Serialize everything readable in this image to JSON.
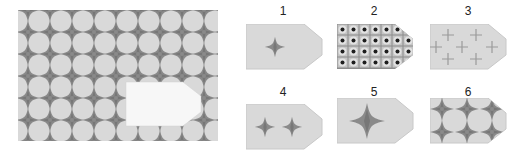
{
  "puzzle": {
    "main_panel": {
      "description": "pattern with missing piece",
      "background_color": "#d9d9d9",
      "star_color": "#8a8a8a",
      "grid": {
        "columns": 9,
        "rows": 7,
        "pitch": 22
      }
    },
    "colors": {
      "tile_bg": "#d9d9d9",
      "star": "#8a8a8a",
      "star_dark": "#777777",
      "cross": "#9a9a9a",
      "cutout": "#f7f7f7",
      "border": "#c8c8c8"
    },
    "options": [
      {
        "label": "1",
        "content": "single-small-star"
      },
      {
        "label": "2",
        "content": "dot-grid"
      },
      {
        "label": "3",
        "content": "plus-crosses"
      },
      {
        "label": "4",
        "content": "two-small-stars"
      },
      {
        "label": "5",
        "content": "single-large-star"
      },
      {
        "label": "6",
        "content": "star-grid-2x3"
      }
    ]
  }
}
